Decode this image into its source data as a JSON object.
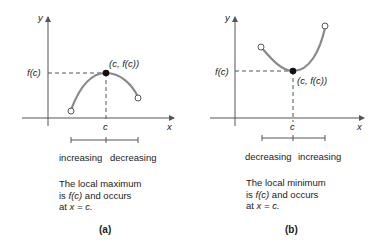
{
  "panels": [
    {
      "id": "a",
      "y_label": "y",
      "x_label": "x",
      "fc_label": "f(c)",
      "c_label": "c",
      "point_label": "(c, f(c))",
      "interval_left": "increasing",
      "interval_right": "decreasing",
      "desc_line1": "The local maximum",
      "desc_line2_pre": "is ",
      "desc_line2_it": "f(c)",
      "desc_line2_post": " and occurs",
      "desc_line3_pre": "at ",
      "desc_line3_it": "x = c.",
      "caption": "(a)"
    },
    {
      "id": "b",
      "y_label": "y",
      "x_label": "x",
      "fc_label": "f(c)",
      "c_label": "c",
      "point_label": "(c, f(c))",
      "interval_left": "decreasing",
      "interval_right": "increasing",
      "desc_line1": "The local minimum",
      "desc_line2_pre": "is ",
      "desc_line2_it": "f(c)",
      "desc_line2_post": " and occurs",
      "desc_line3_pre": "at ",
      "desc_line3_it": "x = c.",
      "caption": "(b)"
    }
  ],
  "colors": {
    "curve": "#8a8a8a",
    "axis": "#555555",
    "text": "#222222"
  }
}
